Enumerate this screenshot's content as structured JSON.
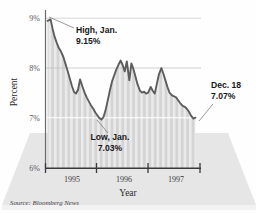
{
  "figure": {
    "source_note": "Source: Bloomberg News",
    "background_color": "#ffffff",
    "floor_color": "#e3e3e3",
    "line_color": "#5a5a5c",
    "fill_color": "#d6d6d6",
    "stripe_color": "#ededed",
    "gridline_color": "#f7f7f7",
    "axis_color": "#4a4a4c"
  },
  "chart_data": {
    "type": "line",
    "title": "",
    "xlabel": "Year",
    "ylabel": "Percent",
    "ylim": [
      6,
      9.35
    ],
    "xlim": [
      1994.92,
      1997.97
    ],
    "ytick_labels": [
      "9%",
      "8%",
      "7%",
      "6%"
    ],
    "ytick_values": [
      9,
      8,
      7,
      6
    ],
    "xtick_labels": [
      "1995",
      "1996",
      "1997"
    ],
    "xtick_values": [
      1995.17,
      1996.17,
      1997.17
    ],
    "grid": true,
    "gridline_values": [
      9,
      8,
      7
    ],
    "legend": "none",
    "series": [
      {
        "name": "Percent",
        "x": [
          1994.96,
          1995.02,
          1995.06,
          1995.1,
          1995.14,
          1995.18,
          1995.22,
          1995.27,
          1995.31,
          1995.35,
          1995.39,
          1995.44,
          1995.48,
          1995.52,
          1995.56,
          1995.6,
          1995.65,
          1995.69,
          1995.73,
          1995.77,
          1995.81,
          1995.86,
          1995.9,
          1995.94,
          1995.98,
          1996.02,
          1996.06,
          1996.1,
          1996.15,
          1996.19,
          1996.23,
          1996.27,
          1996.31,
          1996.36,
          1996.4,
          1996.44,
          1996.48,
          1996.52,
          1996.57,
          1996.61,
          1996.65,
          1996.69,
          1996.73,
          1996.78,
          1996.82,
          1996.86,
          1996.9,
          1996.94,
          1996.99,
          1997.03,
          1997.07,
          1997.11,
          1997.15,
          1997.2,
          1997.24,
          1997.28,
          1997.32,
          1997.36,
          1997.41,
          1997.45,
          1997.49,
          1997.53,
          1997.57,
          1997.62,
          1997.66,
          1997.7,
          1997.74,
          1997.78,
          1997.83,
          1997.87
        ],
        "y": [
          9.12,
          9.15,
          8.95,
          8.78,
          8.66,
          8.55,
          8.48,
          8.36,
          8.22,
          8.08,
          7.93,
          7.74,
          7.62,
          7.58,
          7.66,
          7.88,
          7.72,
          7.6,
          7.5,
          7.42,
          7.34,
          7.26,
          7.18,
          7.12,
          7.06,
          7.03,
          7.08,
          7.22,
          7.46,
          7.66,
          7.84,
          7.96,
          8.08,
          8.2,
          8.28,
          8.18,
          8.05,
          8.26,
          7.86,
          8.22,
          8.1,
          7.94,
          7.78,
          7.64,
          7.6,
          7.62,
          7.58,
          7.6,
          7.72,
          7.64,
          7.58,
          7.78,
          7.98,
          8.12,
          8.0,
          7.86,
          7.72,
          7.6,
          7.54,
          7.52,
          7.5,
          7.44,
          7.38,
          7.32,
          7.3,
          7.26,
          7.2,
          7.12,
          7.05,
          7.07
        ]
      }
    ],
    "annotations": [
      {
        "id": "high",
        "label_line1": "High, Jan.",
        "label_line2": "9.15%",
        "point_x": 1995.02,
        "point_y": 9.15
      },
      {
        "id": "low",
        "label_line1": "Low, Jan.",
        "label_line2": "7.03%",
        "point_x": 1996.02,
        "point_y": 7.03
      },
      {
        "id": "last",
        "label_line1": "Dec. 18",
        "label_line2": "7.07%",
        "point_x": 1997.87,
        "point_y": 7.07
      }
    ]
  }
}
